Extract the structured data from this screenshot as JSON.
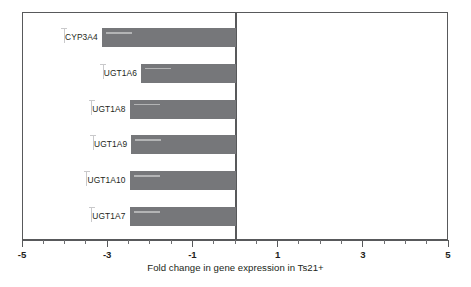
{
  "chart_data": {
    "type": "bar",
    "orientation": "horizontal",
    "title": "",
    "xlabel": "Fold change in gene expression in Ts21+",
    "ylabel": "",
    "xlim": [
      -5,
      5
    ],
    "xticks": [
      -5,
      -3,
      -1,
      1,
      3,
      5
    ],
    "xticklabels": [
      "-5",
      "-3",
      "-1",
      "1",
      "3",
      "5"
    ],
    "minor_tick_step": 0.5,
    "grid": false,
    "legend": null,
    "bar_color": "#76777a",
    "axis_color": "#58595b",
    "zero_line_value": 0,
    "categories": [
      "CYP3A4",
      "UGT1A6",
      "UGT1A8",
      "UGT1A9",
      "UGT1A10",
      "UGT1A7"
    ],
    "values": [
      -3.15,
      -2.23,
      -2.5,
      -2.46,
      -2.5,
      -2.5
    ],
    "bars": [
      {
        "label": "CYP3A4",
        "value": -3.15
      },
      {
        "label": "UGT1A6",
        "value": -2.23
      },
      {
        "label": "UGT1A8",
        "value": -2.5
      },
      {
        "label": "UGT1A9",
        "value": -2.46
      },
      {
        "label": "UGT1A10",
        "value": -2.5
      },
      {
        "label": "UGT1A7",
        "value": -2.5
      }
    ]
  }
}
